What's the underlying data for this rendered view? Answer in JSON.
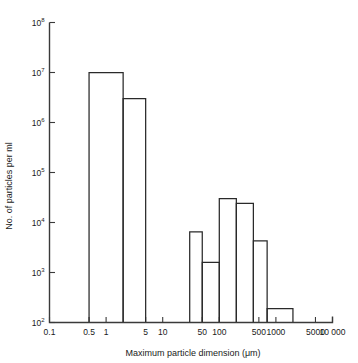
{
  "figure": {
    "background_color": "#ffffff",
    "line_color": "#2a2a2a"
  },
  "axes": {
    "x_title": "Maximum particle dimension (μm)",
    "y_title": "No. of particles per ml",
    "x_ticks": [
      {
        "value": 0.1,
        "label": "0.1"
      },
      {
        "value": 0.5,
        "label": "0.5"
      },
      {
        "value": 1,
        "label": "1"
      },
      {
        "value": 5,
        "label": "5"
      },
      {
        "value": 10,
        "label": "10"
      },
      {
        "value": 50,
        "label": "50"
      },
      {
        "value": 100,
        "label": "100"
      },
      {
        "value": 500,
        "label": "500"
      },
      {
        "value": 1000,
        "label": "1000"
      },
      {
        "value": 5000,
        "label": "5000"
      },
      {
        "value": 10000,
        "label": "10 000"
      }
    ],
    "y_ticks": [
      {
        "value": 100,
        "mantissa": "10",
        "exponent": "2"
      },
      {
        "value": 1000,
        "mantissa": "10",
        "exponent": "3"
      },
      {
        "value": 10000,
        "mantissa": "10",
        "exponent": "4"
      },
      {
        "value": 100000,
        "mantissa": "10",
        "exponent": "5"
      },
      {
        "value": 1000000,
        "mantissa": "10",
        "exponent": "6"
      },
      {
        "value": 10000000,
        "mantissa": "10",
        "exponent": "7"
      },
      {
        "value": 100000000,
        "mantissa": "10",
        "exponent": "8"
      }
    ]
  },
  "chart_data": {
    "type": "bar",
    "title": "",
    "xlabel": "Maximum particle dimension (μm)",
    "ylabel": "No. of particles per ml",
    "xscale": "log",
    "yscale": "log",
    "xlim": [
      0.1,
      10000
    ],
    "ylim": [
      100,
      100000000
    ],
    "grid": false,
    "legend": null,
    "bin_edges_note": "Histogram bins are given as [x_start, x_end] in micrometres; value is particles per ml.",
    "bars": [
      {
        "x_start": 0.5,
        "x_end": 2,
        "value": 10000000,
        "label": "1×10⁷"
      },
      {
        "x_start": 2,
        "x_end": 5,
        "value": 3000000,
        "label": "3×10⁶"
      },
      {
        "x_start": 30,
        "x_end": 50,
        "value": 6500,
        "label": "6.5×10³"
      },
      {
        "x_start": 50,
        "x_end": 100,
        "value": 1600,
        "label": "1.6×10³"
      },
      {
        "x_start": 100,
        "x_end": 200,
        "value": 30000,
        "label": "3×10⁴"
      },
      {
        "x_start": 200,
        "x_end": 400,
        "value": 24000,
        "label": "2.4×10⁴"
      },
      {
        "x_start": 400,
        "x_end": 700,
        "value": 4300,
        "label": "4.3×10³"
      },
      {
        "x_start": 700,
        "x_end": 2000,
        "value": 190,
        "label": "1.9×10²"
      }
    ]
  }
}
